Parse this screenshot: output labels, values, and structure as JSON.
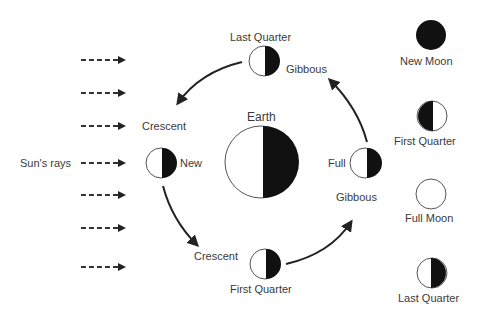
{
  "diagram": {
    "sun_label": "Sun's rays",
    "center_label": "Earth",
    "orbit_labels": {
      "top": "Last Quarter",
      "top_right": "Gibbous",
      "left_upper": "Crescent",
      "left": "New",
      "bottom_left": "Crescent",
      "bottom": "First Quarter",
      "right": "Full",
      "right_lower": "Gibbous"
    },
    "legend": [
      {
        "label": "New Moon"
      },
      {
        "label": "First Quarter"
      },
      {
        "label": "Full Moon"
      },
      {
        "label": "Last Quarter"
      }
    ],
    "colors": {
      "dark": "#111111",
      "line": "#333333",
      "light": "#ffffff"
    }
  }
}
